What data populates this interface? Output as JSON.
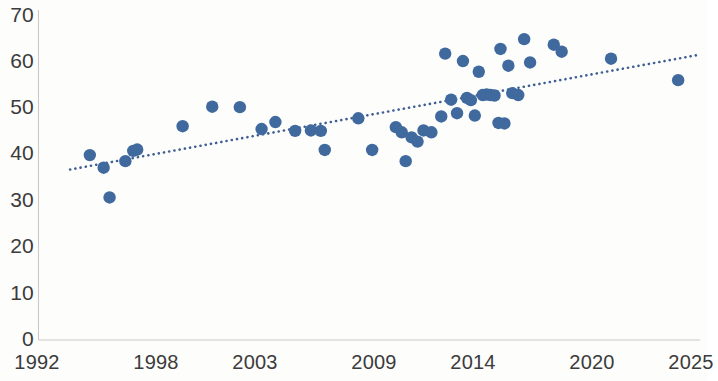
{
  "chart_data": {
    "type": "scatter",
    "title": "",
    "subtitle": "",
    "xlabel": "",
    "ylabel": "",
    "xlim": [
      1992,
      2025.6
    ],
    "ylim": [
      0,
      70
    ],
    "grid": false,
    "legend": null,
    "x_tick_labels": [
      "1992",
      "1998",
      "2003",
      "2009",
      "2014",
      "2020",
      "2025"
    ],
    "x_tick_values": [
      1992,
      1998,
      2003,
      2009,
      2014,
      2020,
      2025
    ],
    "y_tick_labels": [
      "0",
      "10",
      "20",
      "30",
      "40",
      "50",
      "60",
      "70"
    ],
    "y_tick_values": [
      0,
      10,
      20,
      30,
      40,
      50,
      60,
      70
    ],
    "marker_color": "#40699e",
    "marker_radius_px": 6.2,
    "trendline": {
      "style": "dotted",
      "color": "#3f5f94",
      "x_start": 1993.6,
      "y_start": 36.6,
      "x_end": 2025.4,
      "y_end": 61.2
    },
    "points": [
      {
        "x": 1994.6,
        "y": 39.7
      },
      {
        "x": 1995.3,
        "y": 37.0
      },
      {
        "x": 1995.6,
        "y": 30.6
      },
      {
        "x": 1996.4,
        "y": 38.4
      },
      {
        "x": 1996.8,
        "y": 40.6
      },
      {
        "x": 1997.0,
        "y": 40.9
      },
      {
        "x": 1999.3,
        "y": 45.9
      },
      {
        "x": 2000.8,
        "y": 50.1
      },
      {
        "x": 2002.2,
        "y": 50.0
      },
      {
        "x": 2003.3,
        "y": 45.3
      },
      {
        "x": 2004.0,
        "y": 46.8
      },
      {
        "x": 2005.0,
        "y": 44.9
      },
      {
        "x": 2005.8,
        "y": 45.0
      },
      {
        "x": 2006.3,
        "y": 44.9
      },
      {
        "x": 2006.5,
        "y": 40.8
      },
      {
        "x": 2008.2,
        "y": 47.6
      },
      {
        "x": 2008.9,
        "y": 40.8
      },
      {
        "x": 2010.1,
        "y": 45.7
      },
      {
        "x": 2010.4,
        "y": 44.6
      },
      {
        "x": 2010.6,
        "y": 38.4
      },
      {
        "x": 2010.9,
        "y": 43.5
      },
      {
        "x": 2011.2,
        "y": 42.6
      },
      {
        "x": 2011.5,
        "y": 45.0
      },
      {
        "x": 2011.9,
        "y": 44.6
      },
      {
        "x": 2012.4,
        "y": 48.0
      },
      {
        "x": 2012.6,
        "y": 61.5
      },
      {
        "x": 2012.9,
        "y": 51.6
      },
      {
        "x": 2013.2,
        "y": 48.7
      },
      {
        "x": 2013.5,
        "y": 59.9
      },
      {
        "x": 2013.7,
        "y": 52.0
      },
      {
        "x": 2013.9,
        "y": 51.5
      },
      {
        "x": 2014.1,
        "y": 48.2
      },
      {
        "x": 2014.3,
        "y": 57.6
      },
      {
        "x": 2014.5,
        "y": 52.6
      },
      {
        "x": 2014.7,
        "y": 52.7
      },
      {
        "x": 2014.9,
        "y": 52.6
      },
      {
        "x": 2015.1,
        "y": 52.5
      },
      {
        "x": 2015.3,
        "y": 46.6
      },
      {
        "x": 2015.6,
        "y": 46.5
      },
      {
        "x": 2015.4,
        "y": 62.5
      },
      {
        "x": 2015.8,
        "y": 58.9
      },
      {
        "x": 2016.0,
        "y": 53.0
      },
      {
        "x": 2016.3,
        "y": 52.6
      },
      {
        "x": 2016.6,
        "y": 64.6
      },
      {
        "x": 2016.9,
        "y": 59.6
      },
      {
        "x": 2018.1,
        "y": 63.4
      },
      {
        "x": 2018.5,
        "y": 61.9
      },
      {
        "x": 2021.0,
        "y": 60.4
      },
      {
        "x": 2024.4,
        "y": 55.8
      }
    ]
  }
}
